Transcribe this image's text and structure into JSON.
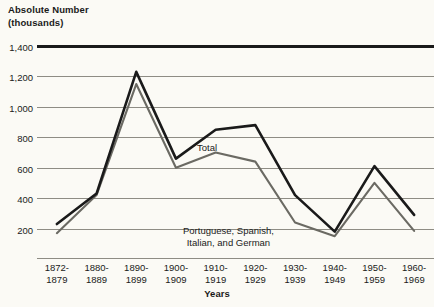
{
  "chart_data": {
    "type": "line",
    "title_line1": "Absolute Number",
    "title_line2": "(thousands)",
    "xlabel": "Years",
    "ylabel": "Absolute Number (thousands)",
    "ylim": [
      0,
      1400
    ],
    "grid": true,
    "grid_axis": "y",
    "legend_position": "inline-annotations",
    "yticks": [
      1400,
      1200,
      1000,
      800,
      600,
      400,
      200
    ],
    "ytick_labels": [
      "1,400",
      "1,200",
      "1,000",
      "800",
      "600",
      "400",
      "200"
    ],
    "categories": [
      "1872-\n1879",
      "1880-\n1889",
      "1890-\n1899",
      "1900-\n1909",
      "1910-\n1919",
      "1920-\n1929",
      "1930-\n1939",
      "1940-\n1949",
      "1950-\n1959",
      "1960-\n1969"
    ],
    "series": [
      {
        "name": "Total",
        "color": "#1a1a1a",
        "values": [
          230,
          430,
          1230,
          660,
          850,
          880,
          420,
          180,
          610,
          290
        ]
      },
      {
        "name": "Portuguese, Spanish, Italian, and German",
        "color": "#6b6a63",
        "values": [
          170,
          420,
          1150,
          600,
          700,
          640,
          240,
          150,
          500,
          185
        ]
      }
    ],
    "annotations": [
      {
        "text": "Total",
        "series": "Total"
      },
      {
        "text": "Portuguese, Spanish,\nItalian, and German",
        "series": "Portuguese, Spanish, Italian, and German"
      }
    ]
  },
  "colors": {
    "background": "#fbfaf5",
    "total_line": "#1a1a1a",
    "subgroup_line": "#6b6a63",
    "gridline": "#8e8c84",
    "text": "#1a1a1a"
  }
}
